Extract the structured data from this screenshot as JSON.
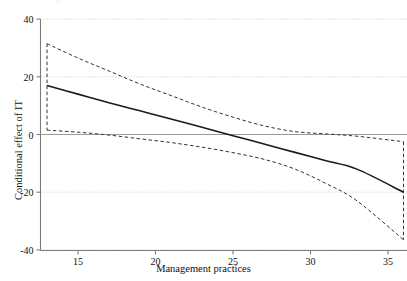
{
  "chart_data": {
    "type": "line",
    "title": "",
    "xlabel": "Management practices",
    "ylabel": "Conditional effect of IT",
    "xlim": [
      12.2,
      36.8
    ],
    "ylim": [
      -44,
      42
    ],
    "xticks": [
      15,
      20,
      25,
      30,
      35
    ],
    "yticks": [
      40,
      20,
      0,
      -20,
      -40
    ],
    "xtick_labels": [
      "15",
      "20",
      "25",
      "30",
      "35"
    ],
    "ytick_labels": [
      "40",
      "20",
      "0",
      "-20",
      "-40"
    ],
    "grid": "horizontal-dotted",
    "legend": "none",
    "zero_reference_line": 0,
    "x": [
      13,
      15,
      17,
      19,
      21,
      23,
      25,
      27,
      29,
      31,
      33,
      36
    ],
    "series": [
      {
        "name": "Conditional effect (point estimate)",
        "style": "solid",
        "color": "#1a1a1a",
        "values": [
          17.0,
          14.0,
          11.0,
          8.2,
          5.4,
          2.5,
          -0.4,
          -3.3,
          -6.2,
          -9.1,
          -12.0,
          -20.0
        ]
      },
      {
        "name": "Upper 95% confidence limit",
        "style": "dashed",
        "color": "#333333",
        "values": [
          31.5,
          26.5,
          22.0,
          17.5,
          13.5,
          9.5,
          6.0,
          3.0,
          1.0,
          0.2,
          -0.6,
          -2.5
        ]
      },
      {
        "name": "Lower 95% confidence limit",
        "style": "dashed",
        "color": "#333333",
        "values": [
          1.5,
          0.8,
          -0.2,
          -1.5,
          -2.8,
          -4.4,
          -6.3,
          -8.6,
          -12.0,
          -17.0,
          -23.0,
          -36.5
        ]
      }
    ],
    "band_end_caps": {
      "left_x": 13,
      "right_x": 36,
      "description": "vertical dashed connectors closing the confidence band at both extremes"
    }
  },
  "figure": {
    "title_remnant": "p"
  }
}
